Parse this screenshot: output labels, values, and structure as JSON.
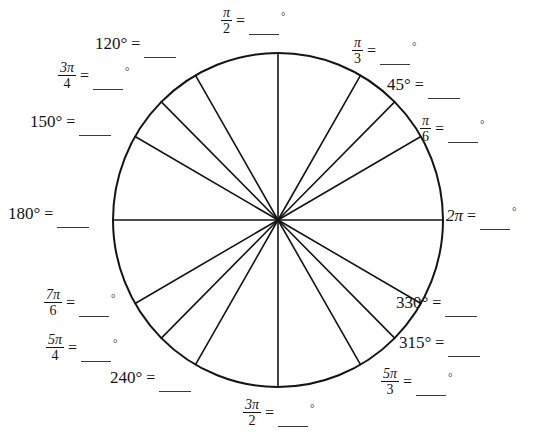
{
  "page": {
    "background_color": "#ffffff",
    "ink_color": "#141414"
  },
  "circle": {
    "center_x": 278,
    "center_y": 220,
    "radius_x": 165,
    "radius_y": 167,
    "stroke_color": "#141414",
    "stroke_width": 2,
    "fill": "none"
  },
  "spokes": {
    "description": "radii drawn from center to circle edge",
    "stroke_color": "#141414",
    "stroke_width": 1.6,
    "angles_deg": [
      0,
      30,
      45,
      60,
      90,
      120,
      135,
      150,
      180,
      210,
      225,
      240,
      270,
      300,
      315,
      330
    ]
  },
  "labels": [
    {
      "id": "pi-over-2",
      "name": "label-pi-over-2",
      "kind": "radian",
      "numerator": "π",
      "denominator": "2",
      "equals": "=",
      "answer_blank": "",
      "answer_unit": "°",
      "angle_deg": 90
    },
    {
      "id": "120",
      "name": "label-120-degrees",
      "kind": "degree",
      "term": "120°",
      "equals": "=",
      "answer_blank": "",
      "answer_unit": "",
      "angle_deg": 120
    },
    {
      "id": "3pi-over-4",
      "name": "label-3pi-over-4",
      "kind": "radian",
      "numerator": "3π",
      "denominator": "4",
      "equals": "=",
      "answer_blank": "",
      "answer_unit": "°",
      "angle_deg": 135
    },
    {
      "id": "150",
      "name": "label-150-degrees",
      "kind": "degree",
      "term": "150°",
      "equals": "=",
      "answer_blank": "",
      "answer_unit": "",
      "angle_deg": 150
    },
    {
      "id": "180",
      "name": "label-180-degrees",
      "kind": "degree",
      "term": "180°",
      "equals": "=",
      "answer_blank": "",
      "answer_unit": "",
      "angle_deg": 180
    },
    {
      "id": "7pi-over-6",
      "name": "label-7pi-over-6",
      "kind": "radian",
      "numerator": "7π",
      "denominator": "6",
      "equals": "=",
      "answer_blank": "",
      "answer_unit": "°",
      "angle_deg": 210
    },
    {
      "id": "5pi-over-4",
      "name": "label-5pi-over-4",
      "kind": "radian",
      "numerator": "5π",
      "denominator": "4",
      "equals": "=",
      "answer_blank": "",
      "answer_unit": "°",
      "angle_deg": 225
    },
    {
      "id": "240",
      "name": "label-240-degrees",
      "kind": "degree",
      "term": "240°",
      "equals": "=",
      "answer_blank": "",
      "answer_unit": "",
      "angle_deg": 240
    },
    {
      "id": "3pi-over-2",
      "name": "label-3pi-over-2",
      "kind": "radian",
      "numerator": "3π",
      "denominator": "2",
      "equals": "=",
      "answer_blank": "",
      "answer_unit": "°",
      "angle_deg": 270
    },
    {
      "id": "5pi-over-3",
      "name": "label-5pi-over-3",
      "kind": "radian",
      "numerator": "5π",
      "denominator": "3",
      "equals": "=",
      "answer_blank": "",
      "answer_unit": "°",
      "angle_deg": 300
    },
    {
      "id": "315",
      "name": "label-315-degrees",
      "kind": "degree",
      "term": "315°",
      "equals": "=",
      "answer_blank": "",
      "answer_unit": "",
      "angle_deg": 315
    },
    {
      "id": "330",
      "name": "label-330-degrees",
      "kind": "degree",
      "term": "330°",
      "equals": "=",
      "answer_blank": "",
      "answer_unit": "",
      "angle_deg": 330
    },
    {
      "id": "2pi",
      "name": "label-2pi",
      "kind": "inline-radian",
      "term": "2π",
      "equals": "=",
      "answer_blank": "",
      "answer_unit": "°",
      "angle_deg": 0
    },
    {
      "id": "pi-over-6",
      "name": "label-pi-over-6",
      "kind": "radian",
      "numerator": "π",
      "denominator": "6",
      "equals": "=",
      "answer_blank": "",
      "answer_unit": "°",
      "angle_deg": 30
    },
    {
      "id": "45",
      "name": "label-45-degrees",
      "kind": "degree",
      "term": "45°",
      "equals": "=",
      "answer_blank": "",
      "answer_unit": "",
      "angle_deg": 45
    },
    {
      "id": "pi-over-3",
      "name": "label-pi-over-3",
      "kind": "radian",
      "numerator": "π",
      "denominator": "3",
      "equals": "=",
      "answer_blank": "",
      "answer_unit": "°",
      "angle_deg": 60
    }
  ]
}
